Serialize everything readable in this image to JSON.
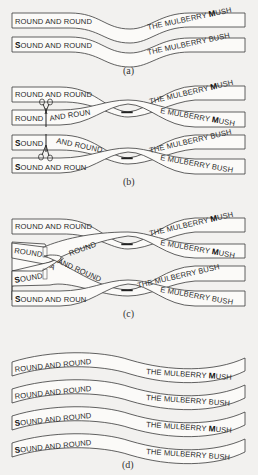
{
  "panels": [
    {
      "id": "a",
      "caption": "(a)",
      "strips": [
        {
          "left": "ROUND AND ROUND",
          "left_first_bold": false,
          "right": "THE MULBERRY MUSH",
          "right_bold_letter": "M"
        },
        {
          "left": "SOUND AND ROUND",
          "left_first_bold": true,
          "right": "THE MULBERRY BUSH",
          "right_bold_letter": ""
        }
      ]
    },
    {
      "id": "b",
      "caption": "(b)",
      "strips": [
        {
          "left": "ROUND AND ROUND",
          "right": "THE MULBERRY MUSH"
        },
        {
          "left_a": "ROUND",
          "left_b": "AND ROUN",
          "right": "E MULBERRY MUSH"
        },
        {
          "left_a": "SOUND",
          "left_b": "AND ROUND",
          "right": "THE MULBERRY BUSH"
        },
        {
          "left": "SOUND AND ROUN",
          "right": "E MULBERRY BUSH"
        }
      ],
      "icons": [
        "scissors-icon",
        "scissors-icon"
      ]
    },
    {
      "id": "c",
      "caption": "(c)",
      "strips": [
        {
          "left": "ROUND AND ROUND",
          "right": "THE MULBERRY MUSH"
        },
        {
          "left_a": "ROUND",
          "left_b": "ROUND",
          "right": "E MULBERRY MUSH"
        },
        {
          "left_a": "SOUND",
          "left_b": "AND ROUND",
          "right": "THE MULBERRY BUSH"
        },
        {
          "left": "SOUND AND ROUN",
          "right": "E MULBERRY BUSH"
        }
      ]
    },
    {
      "id": "d",
      "caption": "(d)",
      "strips": [
        {
          "left": "ROUND AND ROUND",
          "right": "THE MULBERRY MUSH"
        },
        {
          "left": "ROUND AND ROUND",
          "right": "THE MULBERRY BUSH"
        },
        {
          "left": "SOUND AND ROUND",
          "right": "THE MULBERRY MUSH"
        },
        {
          "left": "SOUND AND ROUND",
          "right": "THE MULBERRY BUSH"
        }
      ]
    }
  ],
  "text": {
    "a_cap": "(a)",
    "b_cap": "(b)",
    "c_cap": "(c)",
    "d_cap": "(d)",
    "round_and_round": "ROUND AND ROUND",
    "ound_and_round": "OUND AND ROUND",
    "round": "ROUND",
    "ound": "OUND",
    "and_roun": "AND ROUN",
    "and_round": "AND ROUND",
    "ound_and_roun": "OUND AND ROUN",
    "the_mulberry": "THE MULBERRY ",
    "the_mulberry_bush": "THE MULBERRY BUSH",
    "e_mulberry": "E MULBERRY ",
    "e_mulberry_bush": "E MULBERRY BUSH",
    "ush": "USH",
    "bold_s": "S",
    "bold_m": "M",
    "dash": "–",
    "a": "A"
  }
}
